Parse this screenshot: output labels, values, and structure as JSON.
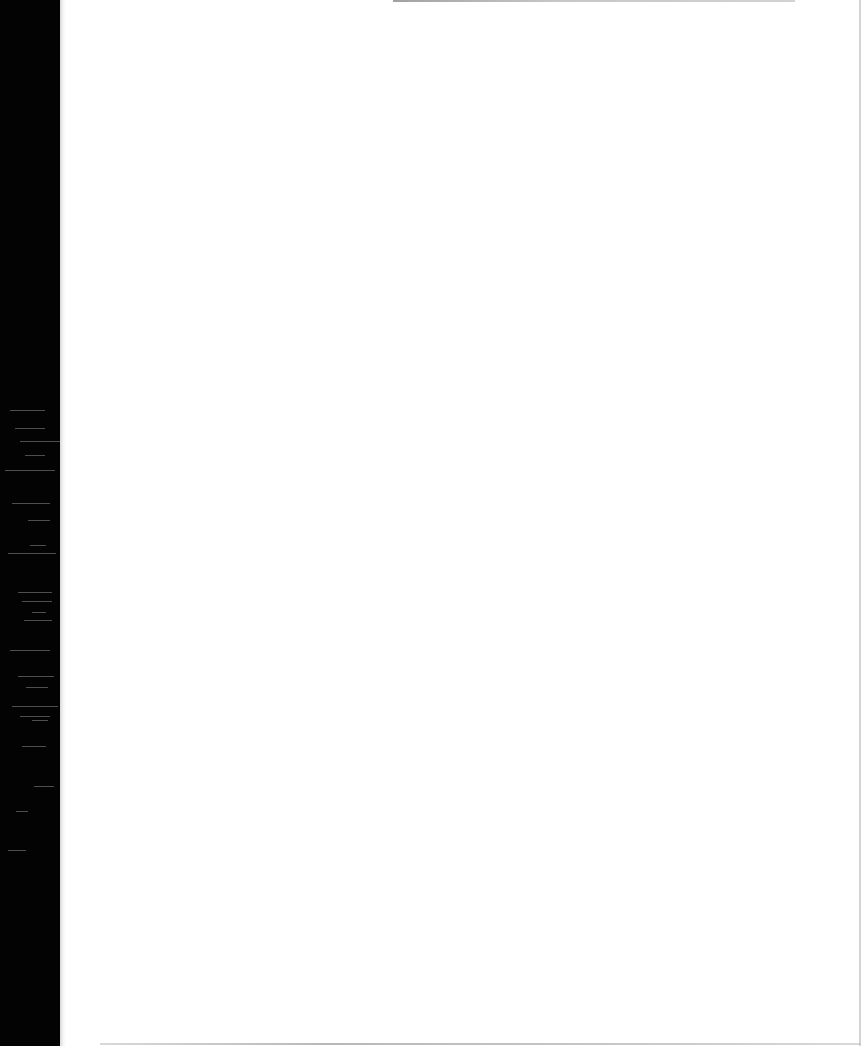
{
  "document": {
    "type": "scanned-page",
    "content": "",
    "text_lines": [],
    "page_number": ""
  },
  "appearance": {
    "background_color": "#ffffff",
    "binding_margin_color": "#030303",
    "edge_shadow_color": "#b8b8b8"
  },
  "binding_streaks": [
    {
      "top": 410,
      "left": 10,
      "width": 35
    },
    {
      "top": 428,
      "left": 15,
      "width": 30
    },
    {
      "top": 441,
      "left": 20,
      "width": 40
    },
    {
      "top": 455,
      "left": 25,
      "width": 20
    },
    {
      "top": 470,
      "left": 5,
      "width": 50
    },
    {
      "top": 503,
      "left": 12,
      "width": 38
    },
    {
      "top": 520,
      "left": 28,
      "width": 22
    },
    {
      "top": 545,
      "left": 30,
      "width": 16
    },
    {
      "top": 553,
      "left": 8,
      "width": 48
    },
    {
      "top": 592,
      "left": 18,
      "width": 34
    },
    {
      "top": 601,
      "left": 22,
      "width": 30
    },
    {
      "top": 612,
      "left": 32,
      "width": 14
    },
    {
      "top": 620,
      "left": 24,
      "width": 28
    },
    {
      "top": 650,
      "left": 10,
      "width": 40
    },
    {
      "top": 676,
      "left": 18,
      "width": 36
    },
    {
      "top": 687,
      "left": 26,
      "width": 22
    },
    {
      "top": 706,
      "left": 12,
      "width": 46
    },
    {
      "top": 716,
      "left": 20,
      "width": 30
    },
    {
      "top": 720,
      "left": 32,
      "width": 16
    },
    {
      "top": 746,
      "left": 22,
      "width": 24
    },
    {
      "top": 786,
      "left": 34,
      "width": 20
    },
    {
      "top": 811,
      "left": 16,
      "width": 12
    },
    {
      "top": 850,
      "left": 8,
      "width": 18
    }
  ]
}
